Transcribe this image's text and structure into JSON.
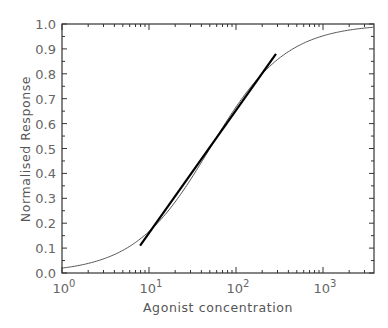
{
  "chart_data": {
    "type": "line",
    "title": "",
    "xlabel": "Agonist concentration",
    "ylabel": "Normalised Response",
    "xscale": "log",
    "xlim": [
      1,
      3860
    ],
    "ylim": [
      0.0,
      1.0
    ],
    "x_ticks": [
      {
        "value": 1,
        "base": "10",
        "exp": "0"
      },
      {
        "value": 10,
        "base": "10",
        "exp": "1"
      },
      {
        "value": 100,
        "base": "10",
        "exp": "2"
      },
      {
        "value": 1000,
        "base": "10",
        "exp": "3"
      }
    ],
    "y_ticks": [
      "0.0",
      "0.1",
      "0.2",
      "0.3",
      "0.4",
      "0.5",
      "0.6",
      "0.7",
      "0.8",
      "0.9",
      "1.0"
    ],
    "grid": false,
    "legend": null,
    "series": [
      {
        "name": "Concentration-response curve",
        "model": "Hill equation, EC50 ≈ 50, slope = 1",
        "ec50": 50,
        "hill_slope": 1,
        "x": [
          1,
          2,
          5,
          10,
          20,
          50,
          100,
          200,
          500,
          1000,
          2000,
          3860
        ],
        "values": [
          0.02,
          0.04,
          0.09,
          0.17,
          0.29,
          0.5,
          0.67,
          0.8,
          0.91,
          0.95,
          0.98,
          0.99
        ],
        "color": "#555555",
        "width": 1
      },
      {
        "name": "Tangent at EC50",
        "x": [
          7.9,
          288
        ],
        "values": [
          0.11,
          0.88
        ],
        "color": "#000000",
        "width": 2.2
      }
    ]
  }
}
